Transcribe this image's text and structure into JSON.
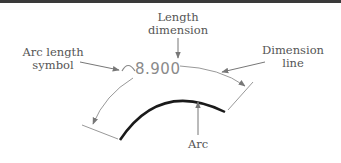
{
  "diagram": {
    "dimension_value": "8.900",
    "labels": {
      "length_dimension_1": "Length",
      "length_dimension_2": "dimension",
      "arc_length_symbol_1": "Arc length",
      "arc_length_symbol_2": "symbol",
      "dimension_line_1": "Dimension",
      "dimension_line_2": "line",
      "arc": "Arc"
    },
    "colors": {
      "arc": "#1a1a1a",
      "dimension_lines": "#8a8a8a",
      "leader_arrows": "#6a6a6a",
      "label_text": "#555555",
      "top_rule": "#3a3a3a"
    }
  }
}
